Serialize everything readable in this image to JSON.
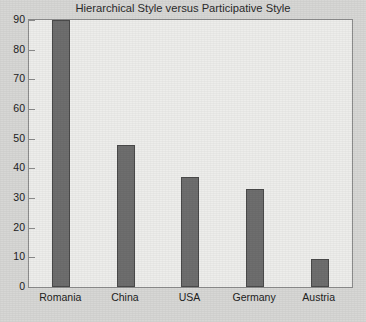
{
  "chart_data": {
    "type": "bar",
    "title": "Hierarchical Style versus Participative Style",
    "xlabel": "",
    "ylabel": "",
    "categories": [
      "Romania",
      "China",
      "USA",
      "Germany",
      "Austria"
    ],
    "values": [
      90,
      48,
      37,
      33,
      9.5
    ],
    "ylim": [
      0,
      90
    ],
    "ytick_labels": [
      "0",
      "10",
      "20",
      "30",
      "40",
      "50",
      "60",
      "70",
      "80",
      "90"
    ],
    "ytick_values": [
      0,
      10,
      20,
      30,
      40,
      50,
      60,
      70,
      80,
      90
    ],
    "grid": false,
    "legend": null,
    "series": [
      {
        "name": "Hierarchical Style versus Participative Style",
        "values": [
          90,
          48,
          37,
          33,
          9.5
        ]
      }
    ]
  },
  "figure": {
    "clipped_top_text": "",
    "colors": {
      "bar_fill": "#6e6e6e",
      "bar_edge": "#4a4a4a",
      "plot_background": "#ededeb",
      "figure_background": "#d7d7d5",
      "frame": "#8c8c8c",
      "text": "#222222"
    }
  }
}
